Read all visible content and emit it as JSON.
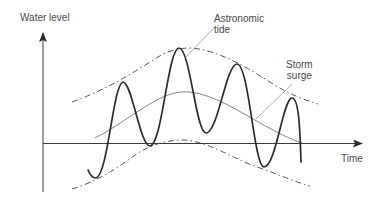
{
  "diagram": {
    "title": "",
    "axes": {
      "y_label": "Water level",
      "x_label": "Time"
    },
    "annotations": {
      "astronomic_tide": {
        "line1": "Astronomic",
        "line2": "tide"
      },
      "storm_surge": {
        "line1": "Storm",
        "line2": "surge"
      }
    },
    "curves": [
      {
        "name": "astronomic-tide-oscillation",
        "style": "solid-thick"
      },
      {
        "name": "upper-envelope",
        "style": "dash-dot"
      },
      {
        "name": "lower-envelope",
        "style": "dash-dot"
      },
      {
        "name": "storm-surge-mean",
        "style": "solid-thin"
      }
    ],
    "colors": {
      "ink": "#2b2b2b",
      "thin_line": "#555555",
      "label_text": "#4a4a4a",
      "background": "#ffffff"
    }
  }
}
